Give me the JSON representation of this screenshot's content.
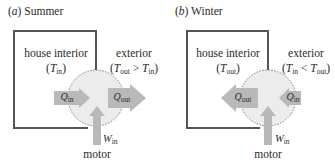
{
  "colors": {
    "box_stroke": "#555555",
    "arrow_fill": "#b9b9b9",
    "pump_fill": "#ececec",
    "pump_stroke": "#7a7a7a",
    "text": "#2a2a2a"
  },
  "panels": [
    {
      "id": "summer",
      "title_letter": "a",
      "title_text": "Summer",
      "interior_label": "house interior",
      "interior_temp_var": "T",
      "interior_temp_sub": "in",
      "exterior_label": "exterior",
      "exterior_relation": {
        "lhs_var": "T",
        "lhs_sub": "out",
        "op": ">",
        "rhs_var": "T",
        "rhs_sub": "in"
      },
      "heat_left": {
        "var": "Q",
        "sub": "in",
        "direction": "right"
      },
      "heat_right": {
        "var": "Q",
        "sub": "out",
        "direction": "right"
      },
      "work": {
        "var": "W",
        "sub": "in"
      },
      "motor_label": "motor"
    },
    {
      "id": "winter",
      "title_letter": "b",
      "title_text": "Winter",
      "interior_label": "house interior",
      "interior_temp_var": "T",
      "interior_temp_sub": "out",
      "exterior_label": "exterior",
      "exterior_relation": {
        "lhs_var": "T",
        "lhs_sub": "in",
        "op": "<",
        "rhs_var": "T",
        "rhs_sub": "out"
      },
      "heat_left": {
        "var": "Q",
        "sub": "out",
        "direction": "left"
      },
      "heat_right": {
        "var": "Q",
        "sub": "in",
        "direction": "left"
      },
      "work": {
        "var": "W",
        "sub": "in"
      },
      "motor_label": "motor"
    }
  ]
}
